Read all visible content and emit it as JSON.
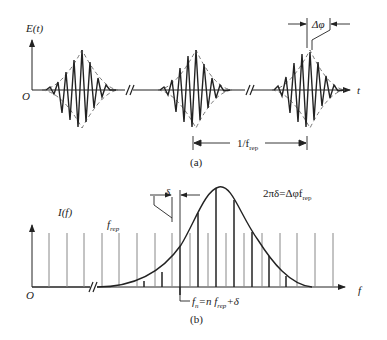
{
  "panel_a": {
    "caption": "(a)",
    "y_axis_label": "E(t)",
    "origin_label": "O",
    "x_axis_label": "t",
    "phase_shift_label": "Δφ",
    "period_label": "1/f",
    "period_sub": "rep",
    "pulse_count": 3
  },
  "panel_b": {
    "caption": "(b)",
    "y_axis_label": "I(f)",
    "origin_label": "O",
    "x_axis_label": "f",
    "rep_label": "f",
    "rep_sub": "rep",
    "offset_label": "δ",
    "relation_pre": "2πδ=Δφf",
    "relation_sub": "rep",
    "mode_label_pre": "f",
    "mode_label_n": "n",
    "mode_label_mid": "=n f",
    "mode_label_sub": "rep",
    "mode_label_post": "+δ"
  },
  "colors": {
    "ink": "#222222",
    "grid_line": "#888888",
    "envelope": "#666666"
  }
}
